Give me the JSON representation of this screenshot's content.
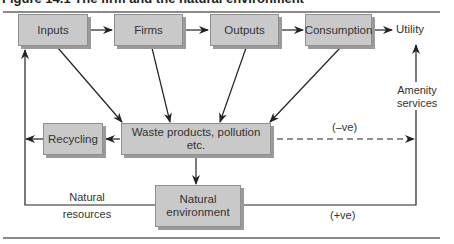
{
  "figure": {
    "title": "Figure 14.1  The firm and the natural environment"
  },
  "nodes": {
    "inputs": "Inputs",
    "firms": "Firms",
    "outputs": "Outputs",
    "consumption": "Consumption",
    "utility": "Utility",
    "recycling": "Recycling",
    "waste": "Waste products, pollution etc.",
    "natural_env_line1": "Natural",
    "natural_env_line2": "environment"
  },
  "labels": {
    "amenity_line1": "Amenity",
    "amenity_line2": "services",
    "negative": "(–ve)",
    "positive": "(+ve)",
    "natural_resources_line1": "Natural",
    "natural_resources_line2": "resources"
  },
  "colors": {
    "box_fill": "#c9c9c9",
    "box_shadow": "#9a9a9a",
    "line": "#222222",
    "rule": "#8a8a8a"
  }
}
